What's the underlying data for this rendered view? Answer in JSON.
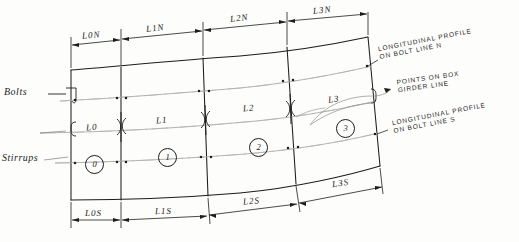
{
  "figure": {
    "type": "engineering-drawing",
    "ink_color": "#1d1d1d",
    "faint_ink_color": "#8d8d8d",
    "background": "#fdfdfc"
  },
  "side_labels": {
    "bolts": "Bolts",
    "stirrups": "Stirrups"
  },
  "top_dimensions": [
    {
      "label": "L0N"
    },
    {
      "label": "L1N"
    },
    {
      "label": "L2N"
    },
    {
      "label": "L3N"
    }
  ],
  "middle_dimensions": [
    {
      "label": "L0"
    },
    {
      "label": "L1"
    },
    {
      "label": "L2"
    },
    {
      "label": "L3"
    }
  ],
  "bottom_dimensions": [
    {
      "label": "L0S"
    },
    {
      "label": "L1S"
    },
    {
      "label": "L2S"
    },
    {
      "label": "L3S"
    }
  ],
  "segment_numbers": [
    "0",
    "1",
    "2",
    "3"
  ],
  "callouts": [
    {
      "name": "profile-north",
      "line1": "LONGITUDINAL PROFILE",
      "line2": "ON BOLT LINE N"
    },
    {
      "name": "points-box-girder",
      "line1": "POINTS ON BOX",
      "line2": "GIRDER LINE"
    },
    {
      "name": "profile-south",
      "line1": "LONGITUDINAL PROFILE",
      "line2": "ON BOLT LINE S"
    }
  ]
}
